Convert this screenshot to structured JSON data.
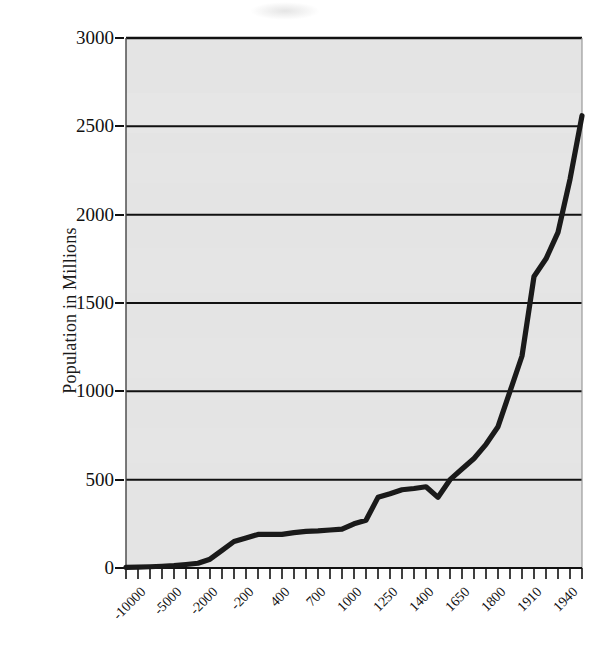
{
  "chart_data": {
    "type": "line",
    "title": "",
    "subtitle": "",
    "xlabel": "",
    "ylabel": "Population in Millions",
    "ylim": [
      0,
      3000
    ],
    "yticks": [
      0,
      500,
      1000,
      1500,
      2000,
      2500,
      3000
    ],
    "ytick_labels": [
      "0",
      "500",
      "1000",
      "1500",
      "2000",
      "2500",
      "3000"
    ],
    "grid": "horizontal",
    "legend": "none",
    "line_color": "#1a1a1a",
    "plot_background": "#e4e4e4",
    "axis_color": "#111111",
    "categories": [
      "-10000",
      "-8000",
      "-6000",
      "-5000",
      "-4000",
      "-3000",
      "-2000",
      "-1000",
      "-500",
      "-200",
      "1",
      "200",
      "400",
      "500",
      "600",
      "700",
      "800",
      "900",
      "1000",
      "1100",
      "1200",
      "1250",
      "1300",
      "1340",
      "1400",
      "1500",
      "1600",
      "1650",
      "1700",
      "1750",
      "1800",
      "1850",
      "1900",
      "1910",
      "1920",
      "1930",
      "1940",
      "1950",
      "1960"
    ],
    "values": [
      4,
      5,
      7,
      10,
      14,
      20,
      27,
      50,
      100,
      150,
      170,
      190,
      190,
      190,
      200,
      207,
      210,
      215,
      220,
      250,
      270,
      400,
      420,
      443,
      450,
      460,
      400,
      500,
      560,
      620,
      700,
      800,
      1000,
      1200,
      1650,
      1750,
      1900,
      2200,
      2560
    ],
    "xtick_labels": [
      "-10000",
      "-5000",
      "-2000",
      "-200",
      "400",
      "700",
      "1000",
      "1250",
      "1400",
      "1650",
      "1800",
      "1910",
      "1940"
    ],
    "xtick_label_indices": [
      0,
      3,
      6,
      9,
      12,
      15,
      18,
      21,
      24,
      27,
      30,
      33,
      36
    ],
    "tick_count": 39,
    "annotations": []
  }
}
